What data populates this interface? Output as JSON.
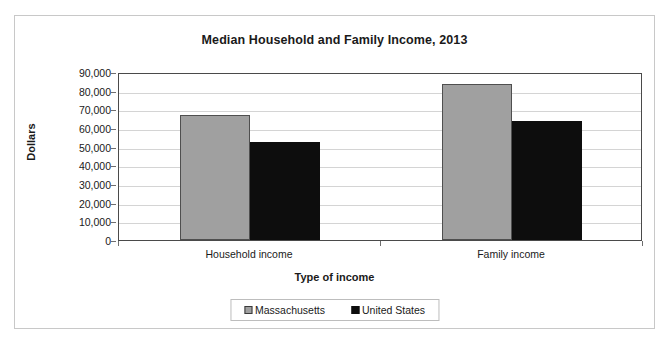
{
  "chart_data": {
    "type": "bar",
    "title": "Median Household and Family Income, 2013",
    "xlabel": "Type of income",
    "ylabel": "Dollars",
    "categories": [
      "Household income",
      "Family income"
    ],
    "series": [
      {
        "name": "Massachusetts",
        "color": "#a0a0a0",
        "values": [
          66800,
          83500
        ]
      },
      {
        "name": "United States",
        "color": "#0d0d0d",
        "values": [
          52250,
          64000
        ]
      }
    ],
    "ylim": [
      0,
      90000
    ],
    "ytick_values": [
      0,
      10000,
      20000,
      30000,
      40000,
      50000,
      60000,
      70000,
      80000,
      90000
    ],
    "ytick_labels": [
      "0",
      "10,000",
      "20,000",
      "30,000",
      "40,000",
      "50,000",
      "60,000",
      "70,000",
      "80,000",
      "90,000"
    ],
    "grid": true,
    "legend_position": "bottom"
  },
  "legend": {
    "entries": [
      {
        "label": "Massachusetts",
        "swatch": "gray-square-swatch"
      },
      {
        "label": "United States",
        "swatch": "black-square-swatch"
      }
    ]
  }
}
